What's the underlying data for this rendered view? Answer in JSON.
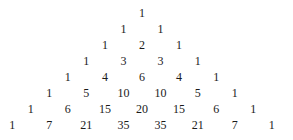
{
  "rows": [
    [
      1
    ],
    [
      1,
      1
    ],
    [
      1,
      2,
      1
    ],
    [
      1,
      3,
      3,
      1
    ],
    [
      1,
      4,
      6,
      4,
      1
    ],
    [
      1,
      5,
      10,
      10,
      5,
      1
    ],
    [
      1,
      6,
      15,
      20,
      15,
      6,
      1
    ],
    [
      1,
      7,
      21,
      35,
      35,
      21,
      7,
      1
    ]
  ],
  "layout": {
    "center_x": 142,
    "top_y": 13,
    "row_step": 16,
    "col_step": 37.1
  }
}
